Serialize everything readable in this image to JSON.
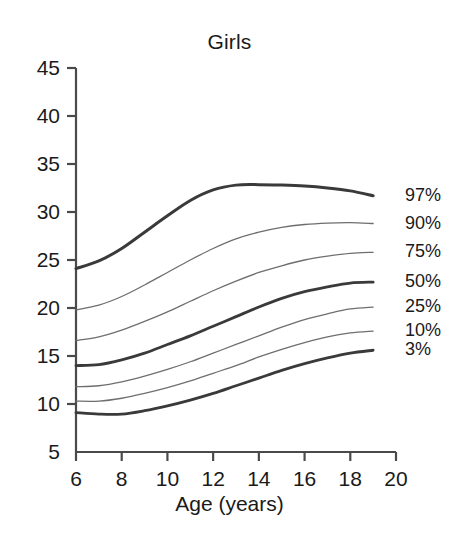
{
  "chart_data": {
    "type": "line",
    "title": "Girls",
    "xlabel": "Age (years)",
    "ylabel": "",
    "xlim": [
      6,
      20
    ],
    "ylim": [
      5,
      45
    ],
    "grid": false,
    "legend_position": "right-of-plot-line-ends",
    "xticks": [
      "6",
      "8",
      "10",
      "12",
      "14",
      "16",
      "18",
      "20"
    ],
    "xtick_values": [
      6,
      8,
      10,
      12,
      14,
      16,
      18,
      20
    ],
    "yticks": [
      "5",
      "10",
      "15",
      "20",
      "25",
      "30",
      "35",
      "40",
      "45"
    ],
    "ytick_values": [
      5,
      10,
      15,
      20,
      25,
      30,
      35,
      40,
      45
    ],
    "x": [
      6,
      7,
      8,
      9,
      10,
      11,
      12,
      13,
      14,
      15,
      16,
      17,
      18,
      19
    ],
    "series": [
      {
        "name": "97%",
        "label": "97%",
        "emphasis": "thick",
        "color": "#3a3a3a",
        "width": 3.0,
        "values": [
          24.1,
          24.9,
          26.2,
          27.9,
          29.6,
          31.2,
          32.3,
          32.8,
          32.85,
          32.8,
          32.7,
          32.5,
          32.2,
          31.7
        ]
      },
      {
        "name": "90%",
        "label": "90%",
        "emphasis": "thin",
        "color": "#6e6e6e",
        "width": 1.3,
        "values": [
          19.8,
          20.3,
          21.2,
          22.4,
          23.7,
          25.0,
          26.2,
          27.2,
          27.9,
          28.4,
          28.7,
          28.85,
          28.9,
          28.8
        ]
      },
      {
        "name": "75%",
        "label": "75%",
        "emphasis": "thin",
        "color": "#6e6e6e",
        "width": 1.3,
        "values": [
          16.6,
          17.0,
          17.7,
          18.6,
          19.6,
          20.7,
          21.8,
          22.8,
          23.7,
          24.4,
          25.0,
          25.4,
          25.7,
          25.8
        ]
      },
      {
        "name": "50%",
        "label": "50%",
        "emphasis": "thick",
        "color": "#3a3a3a",
        "width": 2.8,
        "values": [
          14.0,
          14.1,
          14.6,
          15.3,
          16.2,
          17.1,
          18.1,
          19.1,
          20.1,
          21.0,
          21.7,
          22.2,
          22.6,
          22.7
        ]
      },
      {
        "name": "25%",
        "label": "25%",
        "emphasis": "thin",
        "color": "#6e6e6e",
        "width": 1.3,
        "values": [
          11.8,
          11.9,
          12.3,
          12.9,
          13.6,
          14.4,
          15.3,
          16.2,
          17.1,
          18.0,
          18.8,
          19.4,
          19.9,
          20.1
        ]
      },
      {
        "name": "10%",
        "label": "10%",
        "emphasis": "thin",
        "color": "#6e6e6e",
        "width": 1.3,
        "values": [
          10.3,
          10.3,
          10.6,
          11.1,
          11.7,
          12.4,
          13.2,
          14.0,
          14.9,
          15.7,
          16.4,
          17.0,
          17.4,
          17.6
        ]
      },
      {
        "name": "3%",
        "label": "3%",
        "emphasis": "thick",
        "color": "#3a3a3a",
        "width": 2.8,
        "values": [
          9.1,
          8.95,
          8.95,
          9.3,
          9.8,
          10.4,
          11.1,
          11.9,
          12.7,
          13.5,
          14.2,
          14.8,
          15.3,
          15.6
        ]
      }
    ]
  },
  "axis": {
    "line_color": "#4a4a4a",
    "tick_color": "#4a4a4a"
  }
}
